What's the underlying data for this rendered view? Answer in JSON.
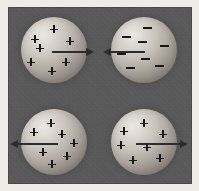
{
  "figure": {
    "width": 199,
    "height": 191,
    "background_color": "#585858",
    "paper_color": "#efece7",
    "glyph_color": "#15171a",
    "arrow_color": "#2a2c2f",
    "sphere_highlight_color": "#e9e7e2",
    "sphere_shadow_color": "#5e5a57"
  },
  "rows": [
    {
      "id": "attraction-row",
      "label": "Opposite charges attract",
      "interaction": "attraction",
      "spheres": [
        {
          "id": "sphere-top-left",
          "charge_sign": "+",
          "charge_symbol": "plus",
          "charge_count": 7,
          "cx": 54,
          "cy": 50,
          "r": 33,
          "charges": [
            {
              "x": 54,
              "y": 29
            },
            {
              "x": 35,
              "y": 39
            },
            {
              "x": 70,
              "y": 41
            },
            {
              "x": 31,
              "y": 62
            },
            {
              "x": 40,
              "y": 48
            },
            {
              "x": 66,
              "y": 62
            },
            {
              "x": 52,
              "y": 71
            }
          ],
          "arrow": {
            "id": "arrow-top-left",
            "direction": "right",
            "points_toward": "other-sphere",
            "x": 52,
            "y": 47,
            "length": 42
          }
        },
        {
          "id": "sphere-top-right",
          "charge_sign": "-",
          "charge_symbol": "minus",
          "charge_count": 8,
          "cx": 144,
          "cy": 50,
          "r": 33,
          "charges": [
            {
              "x": 147,
              "y": 27
            },
            {
              "x": 126,
              "y": 36
            },
            {
              "x": 142,
              "y": 41
            },
            {
              "x": 164,
              "y": 45
            },
            {
              "x": 121,
              "y": 53
            },
            {
              "x": 145,
              "y": 58
            },
            {
              "x": 130,
              "y": 67
            },
            {
              "x": 159,
              "y": 65
            }
          ],
          "arrow": {
            "id": "arrow-top-right",
            "direction": "left",
            "points_toward": "other-sphere",
            "x": 103,
            "y": 47,
            "length": 42
          }
        }
      ]
    },
    {
      "id": "repulsion-row",
      "label": "Like charges repel",
      "interaction": "repulsion",
      "spheres": [
        {
          "id": "sphere-bottom-left",
          "charge_sign": "+",
          "charge_symbol": "plus",
          "charge_count": 7,
          "cx": 54,
          "cy": 142,
          "r": 33,
          "charges": [
            {
              "x": 51,
              "y": 123
            },
            {
              "x": 34,
              "y": 132
            },
            {
              "x": 62,
              "y": 134
            },
            {
              "x": 74,
              "y": 143
            },
            {
              "x": 43,
              "y": 152
            },
            {
              "x": 67,
              "y": 156
            },
            {
              "x": 52,
              "y": 164
            }
          ],
          "arrow": {
            "id": "arrow-bottom-left",
            "direction": "left",
            "points_toward": "away",
            "x": 10,
            "y": 139,
            "length": 48
          }
        },
        {
          "id": "sphere-bottom-right",
          "charge_sign": "+",
          "charge_symbol": "plus",
          "charge_count": 7,
          "cx": 144,
          "cy": 142,
          "r": 33,
          "charges": [
            {
              "x": 144,
              "y": 123
            },
            {
              "x": 124,
              "y": 131
            },
            {
              "x": 163,
              "y": 134
            },
            {
              "x": 121,
              "y": 145
            },
            {
              "x": 147,
              "y": 147
            },
            {
              "x": 133,
              "y": 160
            },
            {
              "x": 160,
              "y": 158
            }
          ],
          "arrow": {
            "id": "arrow-bottom-right",
            "direction": "right",
            "points_toward": "away",
            "x": 136,
            "y": 139,
            "length": 52
          }
        }
      ]
    }
  ]
}
